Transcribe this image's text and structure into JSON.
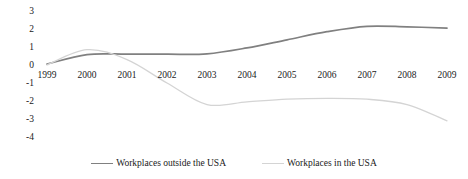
{
  "chart_data": {
    "type": "line",
    "title": "",
    "xlabel": "",
    "ylabel": "",
    "x": [
      1999,
      2000,
      2001,
      2002,
      2003,
      2004,
      2005,
      2006,
      2007,
      2008,
      2009
    ],
    "categories": [
      "1999",
      "2000",
      "2001",
      "2002",
      "2003",
      "2004",
      "2005",
      "2006",
      "2007",
      "2008",
      "2009"
    ],
    "series": [
      {
        "name": "Workplaces outside the USA",
        "color": "#808080",
        "values": [
          0.05,
          0.58,
          0.6,
          0.6,
          0.62,
          0.95,
          1.4,
          1.85,
          2.15,
          2.12,
          2.05
        ]
      },
      {
        "name": "Workplaces in the USA",
        "color": "#d4d4d4",
        "values": [
          0.0,
          0.85,
          0.3,
          -1.0,
          -2.2,
          -2.05,
          -1.9,
          -1.85,
          -1.9,
          -2.2,
          -3.1
        ]
      }
    ],
    "ylim": [
      -4,
      3
    ],
    "yticks": [
      3,
      2,
      1,
      0,
      -1,
      -2,
      -3,
      -4
    ],
    "ytick_labels": [
      "3",
      "2",
      "1",
      "0",
      "-1",
      "-2",
      "-3",
      "-4"
    ],
    "grid": false,
    "legend_position": "bottom",
    "legend": [
      {
        "label": "Workplaces outside the USA",
        "color": "#808080"
      },
      {
        "label": "Workplaces in the USA",
        "color": "#d4d4d4"
      }
    ]
  }
}
